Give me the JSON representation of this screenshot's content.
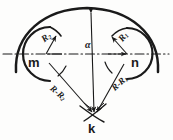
{
  "figure": {
    "stroke_color": "#1a1a1a",
    "background_color": "#fdfdfc",
    "nodes": [
      {
        "id": "m",
        "label": "m",
        "cx": 46,
        "cy": 54
      },
      {
        "id": "n",
        "label": "n",
        "cx": 127,
        "cy": 54
      },
      {
        "id": "k",
        "label": "k",
        "cx": 94,
        "cy": 116
      }
    ],
    "radius_labels": [
      {
        "id": "R2",
        "text": "R",
        "sub": "2",
        "belongs_to": "m"
      },
      {
        "id": "R1",
        "text": "R",
        "sub": "1",
        "belongs_to": "n"
      }
    ],
    "distance_labels": [
      {
        "id": "RR2",
        "text": "R-R",
        "sub": "2",
        "from": "m",
        "to": "k"
      },
      {
        "id": "RR1",
        "text": "R-R",
        "sub": "1",
        "from": "n",
        "to": "k"
      }
    ],
    "angle_label": {
      "id": "alpha",
      "text": "α"
    },
    "axis": {
      "name": "horizontal-center-axis",
      "style": "dash-dot",
      "y": 54
    }
  }
}
